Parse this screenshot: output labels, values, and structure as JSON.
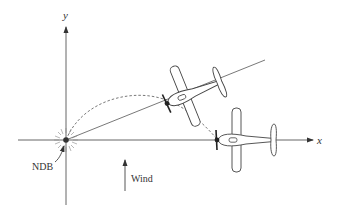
{
  "diagram": {
    "axes": {
      "x_label": "x",
      "y_label": "y"
    },
    "beacon": {
      "label": "NDB"
    },
    "wind": {
      "label": "Wind",
      "direction": "north"
    },
    "aircraft": [
      {
        "name": "airplane-on-bearing-line",
        "heading_deg": -22
      },
      {
        "name": "airplane-on-x-axis",
        "heading_deg": 0
      }
    ],
    "colors": {
      "line": "#555555",
      "text": "#333333",
      "background": "#ffffff"
    }
  }
}
